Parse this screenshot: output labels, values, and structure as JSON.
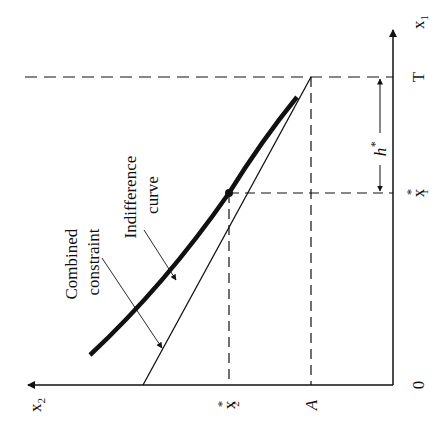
{
  "diagram": {
    "orientation": "rotated 90° counter-clockwise",
    "axes": {
      "vertical_axis_label": "x",
      "vertical_axis_sub": "1",
      "horizontal_axis_label": "x",
      "horizontal_axis_sub": "2",
      "origin_label": "0"
    },
    "ticks": {
      "T": "T",
      "x1_star": "x",
      "x1_star_sub": "1",
      "x2_star": "x",
      "x2_star_sub": "2",
      "star": "*",
      "A": "A"
    },
    "annotations": {
      "h_star": "h",
      "h_star_sup": "*",
      "combined_constraint_line1": "Combined",
      "combined_constraint_line2": "constraint",
      "indifference_curve_line1": "Indifference",
      "indifference_curve_line2": "curve"
    },
    "colors": {
      "ink": "#111111",
      "background": "#ffffff"
    }
  }
}
